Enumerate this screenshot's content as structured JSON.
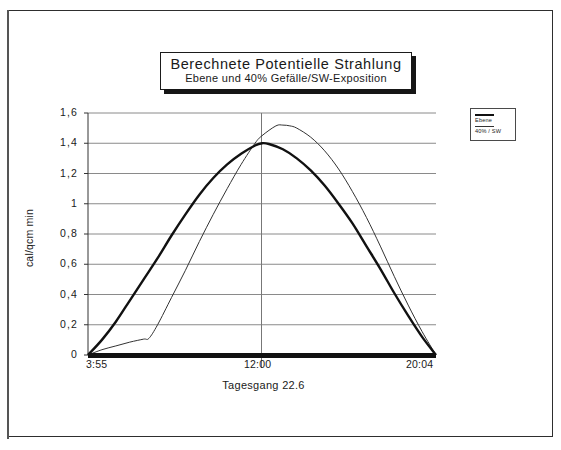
{
  "figure": {
    "title": "Berechnete Potentielle Strahlung",
    "subtitle": "Ebene  und  40% Gefälle/SW-Exposition",
    "scan_artifact": "bleed-through text"
  },
  "legend": {
    "position": "outside-right-top",
    "entries": [
      {
        "label": "Ebene",
        "style": "thick-line",
        "color": "#111111"
      },
      {
        "label": "40% / SW",
        "style": "thin-line",
        "color": "#333333"
      }
    ]
  },
  "chart_data": {
    "type": "line",
    "title": "Berechnete Potentielle Strahlung",
    "subtitle": "Ebene  und  40% Gefälle/SW-Exposition",
    "xlabel": "Tagesgang 22.6",
    "ylabel": "cal/qcm min",
    "grid": "horizontal-and-center-vertical",
    "ylim": [
      0,
      1.6
    ],
    "yticks": [
      0,
      0.2,
      0.4,
      0.6,
      0.8,
      1,
      1.2,
      1.4,
      1.6
    ],
    "yticklabels": [
      "0",
      "0,2",
      "0,4",
      "0,6",
      "0,8",
      "1",
      "1,2",
      "1,4",
      "1,6"
    ],
    "xlim": [
      0,
      1
    ],
    "xticks": [
      0,
      0.5,
      1
    ],
    "xticklabels": [
      "3:55",
      "12:00",
      "20:04"
    ],
    "x_axis_description": "Tageszeit von Sonnenaufgang 3:55 bis Sonnenuntergang 20:04",
    "series": [
      {
        "name": "Ebene",
        "color": "#111111",
        "linewidth": 2.4,
        "x": [
          0.0,
          0.04,
          0.08,
          0.12,
          0.16,
          0.2,
          0.24,
          0.28,
          0.32,
          0.36,
          0.4,
          0.44,
          0.48,
          0.5,
          0.52,
          0.56,
          0.6,
          0.64,
          0.68,
          0.72,
          0.76,
          0.8,
          0.84,
          0.88,
          0.92,
          0.96,
          1.0
        ],
        "y": [
          0.0,
          0.1,
          0.22,
          0.36,
          0.5,
          0.64,
          0.79,
          0.93,
          1.06,
          1.17,
          1.26,
          1.33,
          1.385,
          1.4,
          1.395,
          1.36,
          1.3,
          1.22,
          1.12,
          1.0,
          0.87,
          0.72,
          0.57,
          0.41,
          0.26,
          0.12,
          0.0
        ]
      },
      {
        "name": "40% / SW",
        "color": "#333333",
        "linewidth": 1.0,
        "x": [
          0.0,
          0.04,
          0.08,
          0.12,
          0.16,
          0.175,
          0.2,
          0.24,
          0.28,
          0.32,
          0.36,
          0.4,
          0.44,
          0.48,
          0.5,
          0.54,
          0.56,
          0.58,
          0.6,
          0.64,
          0.68,
          0.72,
          0.76,
          0.8,
          0.84,
          0.88,
          0.92,
          0.96,
          1.0
        ],
        "y": [
          0.0,
          0.035,
          0.06,
          0.085,
          0.105,
          0.11,
          0.2,
          0.38,
          0.56,
          0.75,
          0.93,
          1.1,
          1.26,
          1.4,
          1.45,
          1.515,
          1.52,
          1.515,
          1.5,
          1.44,
          1.35,
          1.23,
          1.08,
          0.91,
          0.72,
          0.52,
          0.33,
          0.155,
          0.0
        ]
      }
    ],
    "baseline": {
      "y": 0,
      "style": "thick-black-rule"
    }
  }
}
